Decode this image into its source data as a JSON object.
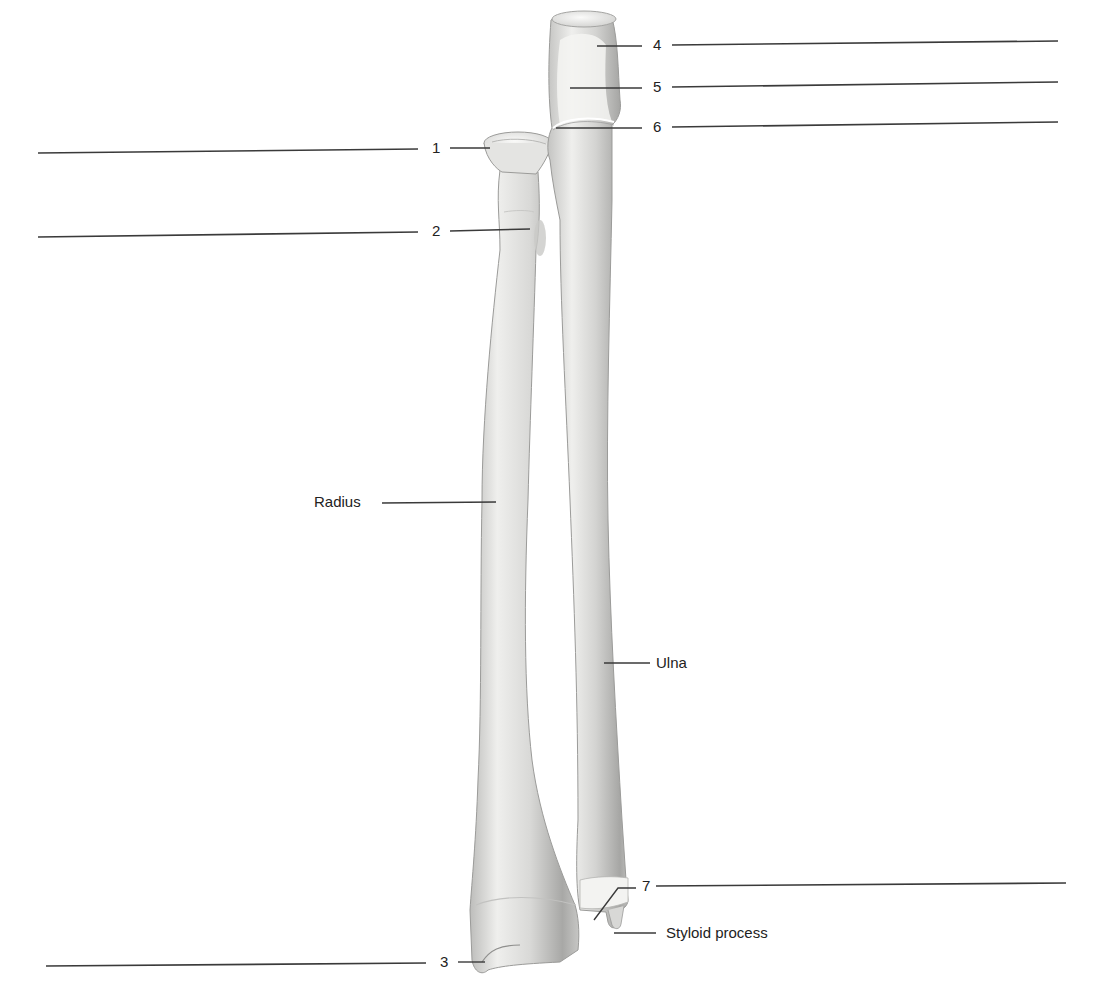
{
  "figure": {
    "bones": [
      {
        "id": "radius",
        "label": "Radius"
      },
      {
        "id": "ulna",
        "label": "Ulna"
      }
    ],
    "named_labels": {
      "radius": "Radius",
      "ulna": "Ulna",
      "styloid": "Styloid process"
    },
    "numbered_labels": [
      {
        "n": "1",
        "side": "left"
      },
      {
        "n": "2",
        "side": "left"
      },
      {
        "n": "3",
        "side": "left"
      },
      {
        "n": "4",
        "side": "right"
      },
      {
        "n": "5",
        "side": "right"
      },
      {
        "n": "6",
        "side": "right"
      },
      {
        "n": "7",
        "side": "right"
      }
    ],
    "colors": {
      "bone_light": "#f2f2f0",
      "bone_mid": "#d6d6d4",
      "bone_dark": "#a9a9a7",
      "line": "#3a3a3a",
      "background": "#ffffff"
    }
  }
}
